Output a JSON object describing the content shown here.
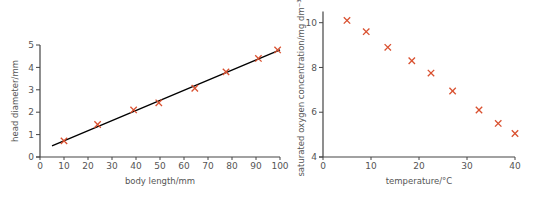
{
  "chart_data": [
    {
      "type": "scatter",
      "title": "",
      "xlabel": "body length/mm",
      "ylabel": "head diameter/mm",
      "xlim": [
        0,
        100
      ],
      "ylim": [
        0,
        5
      ],
      "xticks": [
        0,
        10,
        20,
        30,
        40,
        50,
        60,
        70,
        80,
        90,
        100
      ],
      "yticks": [
        0,
        1,
        2,
        3,
        4,
        5
      ],
      "grid": false,
      "marker": "x",
      "marker_color": "#d9502f",
      "series": [
        {
          "name": "measurements",
          "x": [
            10,
            24,
            39,
            49.5,
            64.5,
            77.5,
            91,
            99
          ],
          "y": [
            0.72,
            1.45,
            2.1,
            2.42,
            3.07,
            3.8,
            4.4,
            4.78
          ]
        }
      ],
      "trendline": {
        "type": "line_of_best_fit",
        "color": "#000000",
        "x": [
          5,
          100
        ],
        "y": [
          0.5,
          4.78
        ]
      }
    },
    {
      "type": "scatter",
      "title": "",
      "xlabel": "temperature/°C",
      "ylabel": "saturated oxygen concentration/mg dm⁻³",
      "xlim": [
        0,
        40
      ],
      "ylim": [
        4,
        10.5
      ],
      "xticks": [
        0,
        10,
        20,
        30,
        40
      ],
      "yticks": [
        4,
        6,
        8,
        10
      ],
      "grid": false,
      "marker": "x",
      "marker_color": "#d9502f",
      "series": [
        {
          "name": "measurements",
          "x": [
            5,
            9,
            13.5,
            18.5,
            22.5,
            27,
            32.5,
            36.5,
            40
          ],
          "y": [
            10.1,
            9.6,
            8.9,
            8.3,
            7.75,
            6.95,
            6.1,
            5.5,
            5.05
          ]
        }
      ]
    }
  ]
}
